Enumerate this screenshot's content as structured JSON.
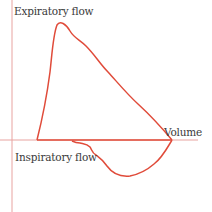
{
  "diagram": {
    "type": "flow-volume-loop",
    "labels": {
      "expiratory": "Expiratory flow",
      "inspiratory": "Inspiratory flow",
      "volume": "Volume"
    },
    "colors": {
      "axis": "#e8a3a0",
      "curve": "#e04b3a",
      "text": "#3a3a3a",
      "background": "#ffffff"
    }
  }
}
